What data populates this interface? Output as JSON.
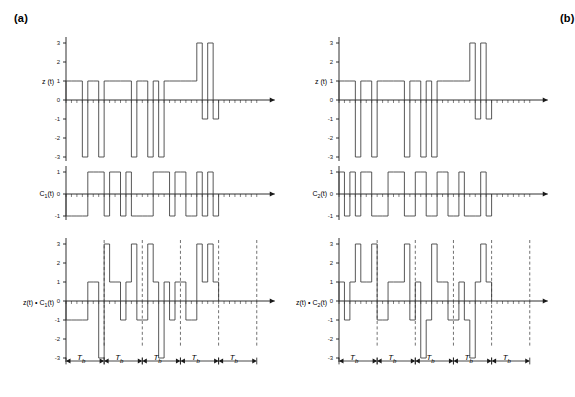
{
  "figure": {
    "type": "signal-waveform-figure",
    "panels": [
      {
        "id": "a",
        "label": "(a)",
        "plots": [
          {
            "id": "z-a",
            "ylabel_html": "z (t)",
            "ylabel_text": "z (t)",
            "yticks": [
              -3,
              -2,
              -1,
              0,
              1,
              2,
              3
            ],
            "ylim": [
              -3,
              3
            ],
            "values": [
              1,
              1,
              1,
              -3,
              1,
              1,
              -3,
              1,
              1,
              1,
              1,
              1,
              -3,
              1,
              1,
              -3,
              1,
              -3,
              1,
              1,
              1,
              1,
              1,
              1,
              3,
              -1,
              3,
              -1
            ]
          },
          {
            "id": "c1-a",
            "ylabel_html": "C<sub>1</sub>(t)",
            "ylabel_text": "C1(t)",
            "yticks": [
              -1,
              0,
              1
            ],
            "ylim": [
              -1,
              1
            ],
            "values": [
              -1,
              -1,
              -1,
              -1,
              1,
              1,
              1,
              -1,
              1,
              1,
              -1,
              1,
              -1,
              -1,
              -1,
              -1,
              1,
              1,
              1,
              -1,
              1,
              1,
              -1,
              -1,
              1,
              -1,
              1,
              -1
            ]
          },
          {
            "id": "zc1-a",
            "ylabel_html": "z(t) &bull; C<sub>1</sub>(t)",
            "ylabel_text": "z(t) • C1(t)",
            "yticks": [
              -3,
              -2,
              -1,
              0,
              1,
              2,
              3
            ],
            "ylim": [
              -3,
              3
            ],
            "values": [
              -1,
              -1,
              -1,
              -1,
              1,
              1,
              -3,
              3,
              1,
              1,
              -1,
              1,
              3,
              -1,
              -1,
              3,
              1,
              -3,
              1,
              -1,
              1,
              1,
              -1,
              -1,
              3,
              1,
              3,
              1
            ]
          }
        ]
      },
      {
        "id": "b",
        "label": "(b)",
        "plots": [
          {
            "id": "z-b",
            "ylabel_html": "z (t)",
            "ylabel_text": "z (t)",
            "yticks": [
              -3,
              -2,
              -1,
              0,
              1,
              2,
              3
            ],
            "ylim": [
              -3,
              3
            ],
            "values": [
              1,
              1,
              1,
              -3,
              1,
              1,
              -3,
              1,
              1,
              1,
              1,
              1,
              -3,
              1,
              1,
              -3,
              1,
              -3,
              1,
              1,
              1,
              1,
              1,
              1,
              3,
              -1,
              3,
              -1
            ]
          },
          {
            "id": "c2-b",
            "ylabel_html": "C<sub>2</sub>(t)",
            "ylabel_text": "C2(t)",
            "yticks": [
              -1,
              0,
              1
            ],
            "ylim": [
              -1,
              1
            ],
            "values": [
              1,
              -1,
              1,
              -1,
              1,
              1,
              -1,
              -1,
              -1,
              1,
              1,
              1,
              -1,
              -1,
              1,
              1,
              -1,
              -1,
              1,
              1,
              -1,
              -1,
              1,
              -1,
              -1,
              -1,
              1,
              -1
            ]
          },
          {
            "id": "zc2-b",
            "ylabel_html": "z(t) &bull; C<sub>2</sub>(t)",
            "ylabel_text": "z(t) • C2(t)",
            "yticks": [
              -3,
              -2,
              -1,
              0,
              1,
              2,
              3
            ],
            "ylim": [
              -3,
              3
            ],
            "values": [
              1,
              -1,
              1,
              3,
              1,
              1,
              3,
              -1,
              -1,
              1,
              1,
              1,
              3,
              -1,
              1,
              -3,
              -1,
              3,
              1,
              1,
              -1,
              -1,
              1,
              -1,
              -3,
              1,
              3,
              1
            ]
          }
        ]
      }
    ],
    "bit_interval_label": "T",
    "bit_interval_sub": "b",
    "bit_interval_count": 5,
    "chips_per_bit": 7,
    "style": {
      "line_color": "#3a3a3a",
      "axis_color": "#1a1a1a",
      "dash_color": "#4d4d4d"
    }
  },
  "chart_data": {
    "type": "line",
    "title": "",
    "xlabel": "",
    "ylabel": "",
    "series": [
      {
        "name": "z(t) (a)",
        "values": [
          1,
          1,
          1,
          -3,
          1,
          1,
          -3,
          1,
          1,
          1,
          1,
          1,
          -3,
          1,
          1,
          -3,
          1,
          -3,
          1,
          1,
          1,
          1,
          1,
          1,
          3,
          -1,
          3,
          -1
        ]
      },
      {
        "name": "C1(t) (a)",
        "values": [
          -1,
          -1,
          -1,
          -1,
          1,
          1,
          1,
          -1,
          1,
          1,
          -1,
          1,
          -1,
          -1,
          -1,
          -1,
          1,
          1,
          1,
          -1,
          1,
          1,
          -1,
          -1,
          1,
          -1,
          1,
          -1
        ]
      },
      {
        "name": "z(t)*C1(t) (a)",
        "values": [
          -1,
          -1,
          -1,
          -1,
          1,
          1,
          -3,
          3,
          1,
          1,
          -1,
          1,
          3,
          -1,
          -1,
          3,
          1,
          -3,
          1,
          -1,
          1,
          1,
          -1,
          -1,
          3,
          1,
          3,
          1
        ]
      },
      {
        "name": "z(t) (b)",
        "values": [
          1,
          1,
          1,
          -3,
          1,
          1,
          -3,
          1,
          1,
          1,
          1,
          1,
          -3,
          1,
          1,
          -3,
          1,
          -3,
          1,
          1,
          1,
          1,
          1,
          1,
          3,
          -1,
          3,
          -1
        ]
      },
      {
        "name": "C2(t) (b)",
        "values": [
          1,
          -1,
          1,
          -1,
          1,
          1,
          -1,
          -1,
          -1,
          1,
          1,
          1,
          -1,
          -1,
          1,
          1,
          -1,
          -1,
          1,
          1,
          -1,
          -1,
          1,
          -1,
          -1,
          -1,
          1,
          -1
        ]
      },
      {
        "name": "z(t)*C2(t) (b)",
        "values": [
          1,
          -1,
          1,
          3,
          1,
          1,
          3,
          -1,
          -1,
          1,
          1,
          1,
          3,
          -1,
          1,
          -3,
          -1,
          3,
          1,
          1,
          -1,
          -1,
          1,
          -1,
          -3,
          1,
          3,
          1
        ]
      }
    ],
    "x": [
      0,
      1,
      2,
      3,
      4,
      5,
      6,
      7,
      8,
      9,
      10,
      11,
      12,
      13,
      14,
      15,
      16,
      17,
      18,
      19,
      20,
      21,
      22,
      23,
      24,
      25,
      26,
      27
    ],
    "ylim": [
      -3,
      3
    ],
    "grid": false,
    "legend": "none"
  }
}
